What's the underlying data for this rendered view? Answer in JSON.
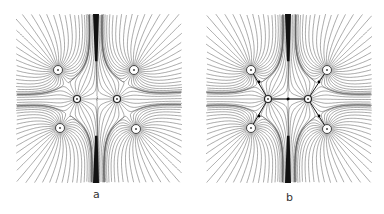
{
  "figure": {
    "panels": [
      {
        "id": "a",
        "label": "a",
        "box": {
          "x": 16,
          "y": 14,
          "w": 166,
          "h": 169
        },
        "label_pos": {
          "x": 93,
          "y": 188
        },
        "outer_charges": [
          [
            42,
            56
          ],
          [
            118,
            56
          ],
          [
            44,
            114
          ],
          [
            120,
            115
          ]
        ],
        "inner_charges": [
          [
            61,
            85
          ],
          [
            101,
            85
          ]
        ],
        "center": [
          80,
          85
        ],
        "nodes": [],
        "separatrix": []
      },
      {
        "id": "b",
        "label": "b",
        "box": {
          "x": 206,
          "y": 14,
          "w": 166,
          "h": 169
        },
        "label_pos": {
          "x": 286,
          "y": 191
        },
        "outer_charges": [
          [
            45,
            56
          ],
          [
            121,
            56
          ],
          [
            45,
            114
          ],
          [
            121,
            115
          ]
        ],
        "inner_charges": [
          [
            62,
            85
          ],
          [
            102,
            85
          ]
        ],
        "center": [
          82,
          85
        ],
        "nodes": [
          [
            53,
            68
          ],
          [
            113,
            68
          ],
          [
            53,
            102
          ],
          [
            113,
            102
          ],
          [
            82,
            85
          ]
        ],
        "separatrix": [
          [
            [
              45,
              56
            ],
            [
              62,
              85
            ]
          ],
          [
            [
              121,
              56
            ],
            [
              102,
              85
            ]
          ],
          [
            [
              45,
              114
            ],
            [
              62,
              85
            ]
          ],
          [
            [
              121,
              115
            ],
            [
              102,
              85
            ]
          ],
          [
            [
              62,
              85
            ],
            [
              102,
              85
            ]
          ]
        ]
      }
    ],
    "colors": {
      "line": "#555555",
      "band": "#111111",
      "background": "#ffffff"
    }
  }
}
